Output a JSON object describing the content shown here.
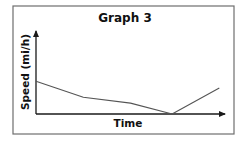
{
  "chart_data": {
    "type": "line",
    "title": "Graph 3",
    "xlabel": "Time",
    "ylabel": "Speed (mi/h)",
    "grid": false,
    "legend": null,
    "x_ticks": [],
    "y_ticks": [],
    "xlim": [
      0,
      1
    ],
    "ylim": [
      0,
      1
    ],
    "note": "Axes unlabeled numerically; values are relative (0–1) estimates of position along each axis.",
    "series": [
      {
        "name": "Speed",
        "x": [
          0.0,
          0.25,
          0.5,
          0.72,
          0.97
        ],
        "values": [
          0.39,
          0.2,
          0.13,
          0.0,
          0.31
        ]
      }
    ]
  },
  "colors": {
    "frame": "#6e6e6e",
    "axis": "#1a1a1a",
    "line": "#555555",
    "text": "#111111"
  }
}
